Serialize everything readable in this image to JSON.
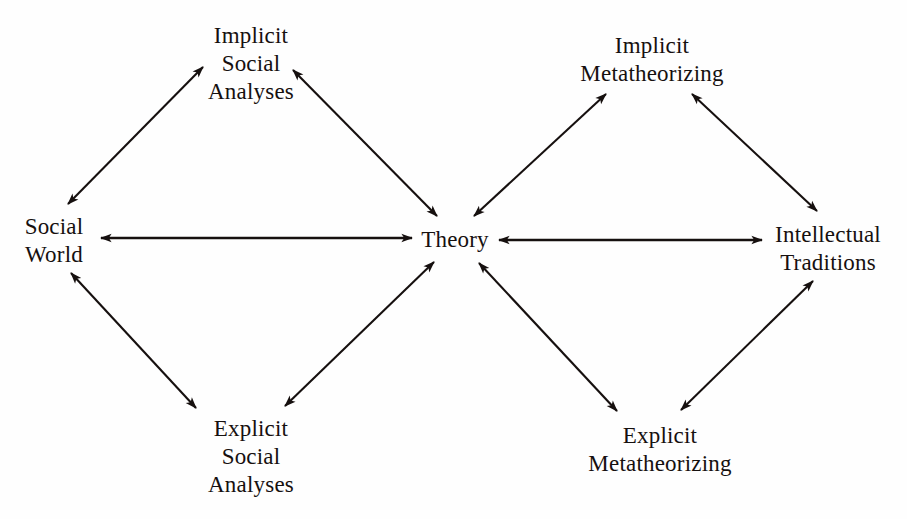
{
  "figure": {
    "type": "diagram",
    "subtype": "double-diamond concept map",
    "background_color": "#fefefe",
    "ink_color": "#16100f"
  },
  "nodes": [
    {
      "id": "implicit-social-analyses",
      "lines": [
        "Implicit",
        "Social",
        "Analyses"
      ],
      "x": 251,
      "y": 64
    },
    {
      "id": "implicit-metatheorizing",
      "lines": [
        "Implicit",
        "Metatheorizing"
      ],
      "x": 652,
      "y": 60
    },
    {
      "id": "social-world",
      "lines": [
        "Social",
        "World"
      ],
      "x": 54,
      "y": 241
    },
    {
      "id": "theory",
      "lines": [
        "Theory"
      ],
      "x": 455,
      "y": 240
    },
    {
      "id": "intellectual-traditions",
      "lines": [
        "Intellectual",
        "Traditions"
      ],
      "x": 828,
      "y": 249
    },
    {
      "id": "explicit-social-analyses",
      "lines": [
        "Explicit",
        "Social",
        "Analyses"
      ],
      "x": 251,
      "y": 457
    },
    {
      "id": "explicit-metatheorizing",
      "lines": [
        "Explicit",
        "Metatheorizing"
      ],
      "x": 660,
      "y": 450
    }
  ],
  "edges": [
    {
      "id": "social-world--implicit-social-analyses",
      "from": "social-world",
      "to": "implicit-social-analyses",
      "arrowheads": "both",
      "x1": 68,
      "y1": 204,
      "x2": 203,
      "y2": 67
    },
    {
      "id": "implicit-social-analyses--theory",
      "from": "implicit-social-analyses",
      "to": "theory",
      "arrowheads": "both",
      "x1": 293,
      "y1": 70,
      "x2": 437,
      "y2": 216
    },
    {
      "id": "social-world--theory",
      "from": "social-world",
      "to": "theory",
      "arrowheads": "both",
      "x1": 101,
      "y1": 238,
      "x2": 412,
      "y2": 238
    },
    {
      "id": "social-world--explicit-social-analyses",
      "from": "social-world",
      "to": "explicit-social-analyses",
      "arrowheads": "both",
      "x1": 71,
      "y1": 273,
      "x2": 196,
      "y2": 408
    },
    {
      "id": "explicit-social-analyses--theory",
      "from": "explicit-social-analyses",
      "to": "theory",
      "arrowheads": "both",
      "x1": 285,
      "y1": 406,
      "x2": 434,
      "y2": 262
    },
    {
      "id": "theory--implicit-metatheorizing",
      "from": "theory",
      "to": "implicit-metatheorizing",
      "arrowheads": "both",
      "x1": 474,
      "y1": 216,
      "x2": 606,
      "y2": 94
    },
    {
      "id": "implicit-metatheorizing--intellectual-traditions",
      "from": "implicit-metatheorizing",
      "to": "intellectual-traditions",
      "arrowheads": "both",
      "x1": 692,
      "y1": 94,
      "x2": 817,
      "y2": 211
    },
    {
      "id": "theory--intellectual-traditions",
      "from": "theory",
      "to": "intellectual-traditions",
      "arrowheads": "both",
      "x1": 499,
      "y1": 240,
      "x2": 762,
      "y2": 240
    },
    {
      "id": "theory--explicit-metatheorizing",
      "from": "theory",
      "to": "explicit-metatheorizing",
      "arrowheads": "both",
      "x1": 479,
      "y1": 263,
      "x2": 617,
      "y2": 411
    },
    {
      "id": "explicit-metatheorizing--intellectual-traditions",
      "from": "explicit-metatheorizing",
      "to": "intellectual-traditions",
      "arrowheads": "both",
      "x1": 681,
      "y1": 410,
      "x2": 813,
      "y2": 281
    }
  ]
}
